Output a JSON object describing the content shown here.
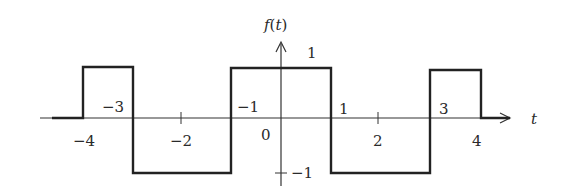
{
  "chart_data": {
    "type": "line",
    "subtype": "step",
    "title": "",
    "ylabel": "f(t)",
    "xlabel": "t",
    "x_ticks": [
      -4,
      -3,
      -2,
      -1,
      0,
      1,
      2,
      3,
      4
    ],
    "x_tick_labels": [
      "−4",
      "−3",
      "−2",
      "−1",
      "0",
      "1",
      "2",
      "3",
      "4"
    ],
    "y_tick_labels": [
      "1",
      "−1"
    ],
    "y_ticks": [
      1,
      -1
    ],
    "xlim": [
      -4.8,
      4.8
    ],
    "ylim": [
      -1.3,
      1.5
    ],
    "grid": false,
    "legend": null,
    "series": [
      {
        "name": "f(t)",
        "points": [
          [
            -4.8,
            0
          ],
          [
            -4,
            0
          ],
          [
            -4,
            1
          ],
          [
            -3,
            1
          ],
          [
            -3,
            -1
          ],
          [
            -1,
            -1
          ],
          [
            -1,
            1
          ],
          [
            1,
            1
          ],
          [
            1,
            -1
          ],
          [
            3,
            -1
          ],
          [
            3,
            1
          ],
          [
            4,
            1
          ],
          [
            4,
            0
          ],
          [
            4.4,
            0
          ]
        ]
      }
    ],
    "segments": [
      {
        "from": -4,
        "to": -3,
        "value": 1
      },
      {
        "from": -3,
        "to": -1,
        "value": -1
      },
      {
        "from": -1,
        "to": 1,
        "value": 1
      },
      {
        "from": 1,
        "to": 3,
        "value": -1
      },
      {
        "from": 3,
        "to": 4,
        "value": 1
      }
    ]
  },
  "labels": {
    "y_axis": "f(t)",
    "x_axis": "t",
    "ticks": {
      "m4": "−4",
      "m3": "−3",
      "m2": "−2",
      "m1": "−1",
      "zero": "0",
      "p1": "1",
      "p2": "2",
      "p3": "3",
      "p4": "4",
      "y_p1": "1",
      "y_m1": "−1"
    }
  }
}
